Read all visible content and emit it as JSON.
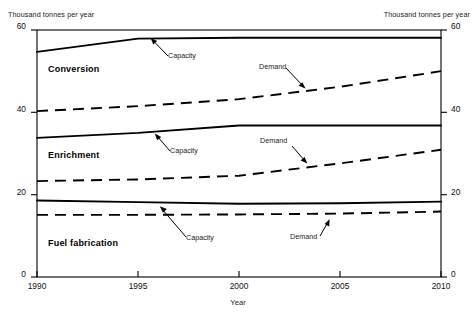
{
  "chart_data": {
    "type": "line",
    "title": "",
    "xlabel": "Year",
    "ylabel": "Thousand tonnes per year",
    "ylabel_left": "Thousand tonnes per year",
    "ylabel_right": "Thousand tonnes per year",
    "x": [
      1990,
      1995,
      2000,
      2005,
      2010
    ],
    "xlim": [
      1990,
      2010
    ],
    "ylim": [
      0,
      60
    ],
    "xticks": [
      "1990",
      "1995",
      "2000",
      "2005",
      "2010"
    ],
    "yticks": [
      "0",
      "20",
      "40",
      "60"
    ],
    "yticks_right": [
      "0",
      "20",
      "40",
      "60"
    ],
    "grid": false,
    "legend": "inline-annotations",
    "groups": [
      {
        "name": "Conversion",
        "label_pos": {
          "x": 48,
          "y": 64
        },
        "series": [
          {
            "name": "Capacity",
            "style": "solid",
            "x": [
              1990,
              1995,
              2000,
              2005,
              2010
            ],
            "values": [
              54.7,
              57.9,
              58.1,
              58.1,
              58.1
            ],
            "annotation": "Capacity",
            "anno_pos": {
              "x": 168,
              "y": 51
            },
            "arrow": {
              "x1": 164,
              "y1": 50,
              "x2": 152,
              "y2": 38
            }
          },
          {
            "name": "Demand",
            "style": "dashed",
            "x": [
              1990,
              1995,
              2000,
              2005,
              2010
            ],
            "values": [
              40.3,
              41.5,
              43.2,
              46.2,
              50.0
            ],
            "annotation": "Demand",
            "anno_pos": {
              "x": 262,
              "y": 63
            },
            "arrow": {
              "x1": 280,
              "y1": 66,
              "x2": 304,
              "y2": 88
            }
          }
        ]
      },
      {
        "name": "Enrichment",
        "label_pos": {
          "x": 48,
          "y": 150
        },
        "series": [
          {
            "name": "Capacity",
            "style": "solid",
            "x": [
              1990,
              1995,
              2000,
              2005,
              2010
            ],
            "values": [
              33.8,
              35.0,
              36.8,
              36.8,
              36.8
            ],
            "annotation": "Capacity",
            "anno_pos": {
              "x": 168,
              "y": 146
            },
            "arrow": {
              "x1": 166,
              "y1": 145,
              "x2": 156,
              "y2": 133
            }
          },
          {
            "name": "Demand",
            "style": "dashed",
            "x": [
              1990,
              1995,
              2000,
              2005,
              2010
            ],
            "values": [
              23.3,
              23.7,
              24.6,
              27.6,
              30.9
            ],
            "annotation": "Demand",
            "anno_pos": {
              "x": 262,
              "y": 141
            },
            "arrow": {
              "x1": 288,
              "y1": 145,
              "x2": 306,
              "y2": 162
            }
          }
        ]
      },
      {
        "name": "Fuel fabrication",
        "label_pos": {
          "x": 48,
          "y": 238
        },
        "series": [
          {
            "name": "Capacity",
            "style": "solid",
            "x": [
              1990,
              1995,
              2000,
              2005,
              2010
            ],
            "values": [
              18.6,
              18.2,
              17.8,
              17.9,
              18.3
            ],
            "annotation": "Capacity",
            "anno_pos": {
              "x": 188,
              "y": 237
            },
            "arrow": {
              "x1": 186,
              "y1": 234,
              "x2": 161,
              "y2": 208
            }
          },
          {
            "name": "Demand",
            "style": "dashed",
            "x": [
              1990,
              1995,
              2000,
              2005,
              2010
            ],
            "values": [
              15.1,
              15.1,
              15.2,
              15.4,
              15.9
            ],
            "annotation": "Demand",
            "anno_pos": {
              "x": 291,
              "y": 239
            },
            "arrow": {
              "x1": 316,
              "y1": 236,
              "x2": 327,
              "y2": 222
            }
          }
        ]
      }
    ]
  },
  "axes": {
    "left_caption": "Thousand tonnes per year",
    "right_caption": "Thousand tonnes per year",
    "x_title": "Year",
    "x_tick_1990": "1990",
    "x_tick_1995": "1995",
    "x_tick_2000": "2000",
    "x_tick_2005": "2005",
    "x_tick_2010": "2010",
    "y_tick_0": "0",
    "y_tick_20": "20",
    "y_tick_40": "40",
    "y_tick_60": "60",
    "yr_tick_0": "0",
    "yr_tick_20": "20",
    "yr_tick_40": "40",
    "yr_tick_60": "60"
  },
  "labels": {
    "conversion": "Conversion",
    "enrichment": "Enrichment",
    "fuel_fabrication": "Fuel fabrication",
    "conv_capacity": "Capacity",
    "conv_demand": "Demand",
    "enr_capacity": "Capacity",
    "enr_demand": "Demand",
    "fuel_capacity": "Capacity",
    "fuel_demand": "Demand"
  },
  "colors": {
    "line": "#000000",
    "axis": "#000000",
    "text": "#111111",
    "background": "#ffffff"
  }
}
